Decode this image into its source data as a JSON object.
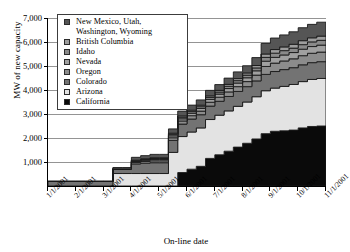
{
  "chart_data": {
    "type": "area",
    "title": "",
    "xlabel": "On-line date",
    "ylabel": "MW of new capacity",
    "stacked": true,
    "grid": true,
    "legend_position": "top-left-inside",
    "ylim": [
      0,
      7000
    ],
    "yticks": [
      1000,
      2000,
      3000,
      4000,
      5000,
      6000,
      7000
    ],
    "ytick_labels": [
      "1,000",
      "2,000",
      "3,000",
      "4,000",
      "5,000",
      "6,000",
      "7,000"
    ],
    "xticks": [
      "1/1/2001",
      "2/1/2001",
      "3/1/2001",
      "4/1/2001",
      "5/1/2001",
      "6/1/2001",
      "7/1/2001",
      "8/1/2001",
      "9/1/2001",
      "10/1/2001",
      "11/1/2001"
    ],
    "x": [
      "1/1/2001",
      "1/20/2001",
      "2/1/2001",
      "3/1/2001",
      "3/20/2001",
      "4/1/2001",
      "5/1/2001",
      "5/5/2001",
      "5/20/2001",
      "6/1/2001",
      "6/10/2001",
      "6/20/2001",
      "6/25/2001",
      "7/1/2001",
      "7/5/2001",
      "7/10/2001",
      "7/15/2001",
      "7/20/2001",
      "7/25/2001",
      "8/1/2001",
      "8/10/2001",
      "8/20/2001",
      "9/1/2001",
      "9/5/2001",
      "9/10/2001",
      "9/20/2001",
      "10/1/2001",
      "10/10/2001",
      "10/20/2001",
      "11/1/2001",
      "11/15/2001"
    ],
    "series": [
      {
        "name": "California",
        "color": "#0a0a0a",
        "values": [
          0,
          0,
          0,
          0,
          0,
          0,
          0,
          0,
          0,
          0,
          0,
          0,
          0,
          0,
          560,
          700,
          820,
          1150,
          1300,
          1450,
          1620,
          1780,
          1960,
          2180,
          2280,
          2300,
          2330,
          2420,
          2480,
          2500,
          2500
        ]
      },
      {
        "name": "Arizona",
        "color": "#e3e3e3",
        "values": [
          0,
          0,
          0,
          0,
          0,
          0,
          0,
          520,
          520,
          520,
          520,
          520,
          520,
          1400,
          1500,
          1550,
          1600,
          1620,
          1650,
          1680,
          1700,
          1720,
          1760,
          1790,
          1800,
          1850,
          1900,
          1930,
          1960,
          1980,
          1980
        ]
      },
      {
        "name": "Colorado",
        "color": "#737373",
        "values": [
          190,
          190,
          190,
          190,
          190,
          190,
          190,
          190,
          190,
          400,
          430,
          450,
          450,
          500,
          520,
          540,
          550,
          560,
          580,
          600,
          620,
          640,
          660,
          680,
          690,
          700,
          700,
          700,
          700,
          700,
          700
        ]
      },
      {
        "name": "Oregon",
        "color": "#8c8c8c",
        "values": [
          0,
          0,
          0,
          0,
          0,
          0,
          0,
          0,
          0,
          60,
          70,
          80,
          80,
          110,
          130,
          140,
          150,
          160,
          170,
          190,
          200,
          210,
          240,
          330,
          350,
          360,
          370,
          380,
          390,
          400,
          400
        ]
      },
      {
        "name": "Nevada",
        "color": "#a0a0a0",
        "values": [
          0,
          0,
          0,
          0,
          0,
          0,
          0,
          0,
          0,
          40,
          50,
          55,
          55,
          80,
          90,
          100,
          110,
          120,
          130,
          140,
          150,
          160,
          180,
          220,
          240,
          250,
          260,
          270,
          280,
          290,
          290
        ]
      },
      {
        "name": "Idaho",
        "color": "#8a8a8a",
        "values": [
          0,
          0,
          0,
          0,
          0,
          0,
          0,
          0,
          0,
          30,
          35,
          40,
          40,
          60,
          65,
          70,
          75,
          80,
          85,
          95,
          100,
          110,
          120,
          160,
          175,
          180,
          185,
          190,
          195,
          200,
          200
        ]
      },
      {
        "name": "British Columbia",
        "color": "#9d9d9d",
        "values": [
          0,
          0,
          0,
          0,
          0,
          0,
          0,
          0,
          0,
          25,
          30,
          32,
          32,
          50,
          55,
          60,
          62,
          65,
          70,
          80,
          85,
          90,
          100,
          140,
          150,
          155,
          160,
          165,
          170,
          175,
          175
        ]
      },
      {
        "name": "New Mexico, Utah, Washington, Wyoming",
        "color": "#555555",
        "values": [
          0,
          0,
          0,
          0,
          0,
          0,
          0,
          60,
          60,
          120,
          130,
          140,
          140,
          180,
          200,
          210,
          220,
          230,
          240,
          260,
          280,
          300,
          330,
          440,
          480,
          500,
          520,
          540,
          560,
          580,
          580
        ]
      }
    ]
  },
  "legend": {
    "items": [
      {
        "label": "New Mexico, Utah,\nWashington, Wyoming",
        "color": "#555555",
        "two_line": true
      },
      {
        "label": "British Columbia",
        "color": "#9d9d9d",
        "two_line": false
      },
      {
        "label": "Idaho",
        "color": "#8a8a8a",
        "two_line": false
      },
      {
        "label": "Nevada",
        "color": "#a0a0a0",
        "two_line": false
      },
      {
        "label": "Oregon",
        "color": "#8c8c8c",
        "two_line": false
      },
      {
        "label": "Colorado",
        "color": "#737373",
        "two_line": false
      },
      {
        "label": "Arizona",
        "color": "#e3e3e3",
        "two_line": false
      },
      {
        "label": "California",
        "color": "#0a0a0a",
        "two_line": false
      }
    ]
  }
}
